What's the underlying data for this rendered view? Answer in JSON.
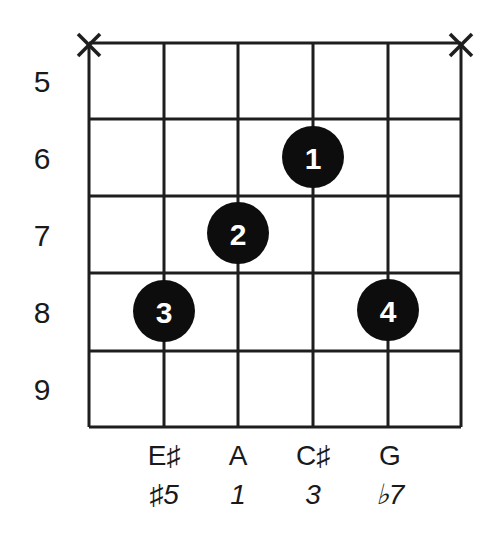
{
  "diagram": {
    "type": "guitar-chord-diagram",
    "strings": 6,
    "frets_shown": [
      5,
      6,
      7,
      8,
      9
    ],
    "fret_labels": [
      "5",
      "6",
      "7",
      "8",
      "9"
    ],
    "muted_strings": [
      {
        "string": 1,
        "label": "X"
      },
      {
        "string": 6,
        "label": "X"
      }
    ],
    "fingerings": [
      {
        "finger": "1",
        "string": 4,
        "fret": 6
      },
      {
        "finger": "2",
        "string": 3,
        "fret": 7
      },
      {
        "finger": "3",
        "string": 2,
        "fret": 8
      },
      {
        "finger": "4",
        "string": 5,
        "fret": 8
      }
    ],
    "notes": [
      {
        "string": 2,
        "name": "E♯",
        "interval": "♯5"
      },
      {
        "string": 3,
        "name": "A",
        "interval": "1"
      },
      {
        "string": 4,
        "name": "C♯",
        "interval": "3"
      },
      {
        "string": 5,
        "name": "G",
        "interval": "♭7"
      }
    ],
    "colors": {
      "line": "#1e1e1e",
      "dot": "#0d0d0d",
      "dot_text": "#ffffff",
      "text": "#1a1a1a"
    }
  }
}
